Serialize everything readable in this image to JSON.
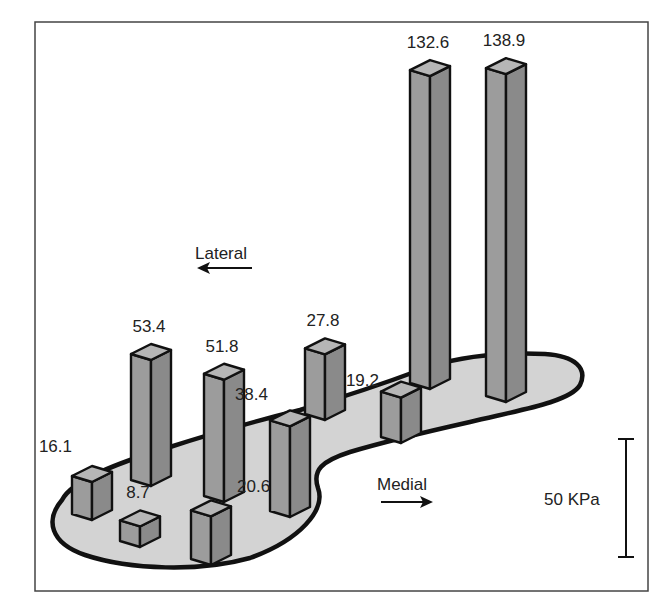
{
  "chart_data": {
    "type": "bar",
    "subtype": "3d-bars-on-foot-outline",
    "title": "",
    "unit": "KPa",
    "categories": [
      "heel-lateral",
      "heel-medial",
      "midfoot-lateral-1",
      "heel-center",
      "midfoot-lateral-2",
      "midfoot-medial",
      "midfoot-lateral-3",
      "forefoot-medial-1",
      "forefoot-1",
      "forefoot-2"
    ],
    "values": [
      16.1,
      8.7,
      53.4,
      20.6,
      51.8,
      38.4,
      27.8,
      19.2,
      132.6,
      138.9
    ],
    "labels": [
      "16.1",
      "8.7",
      "53.4",
      "20.6",
      "51.8",
      "38.4",
      "27.8",
      "19.2",
      "132.6",
      "138.9"
    ],
    "annotations": {
      "lateral": "Lateral",
      "medial": "Medial"
    },
    "scale_bar": {
      "value": 50,
      "label": "50 KPa"
    },
    "colors": {
      "foot_fill": "#d3d3d3",
      "bar_front": "#9c9c9c",
      "bar_side": "#8a8a8a",
      "bar_top": "#b6b6b6",
      "outline": "#111111"
    }
  }
}
